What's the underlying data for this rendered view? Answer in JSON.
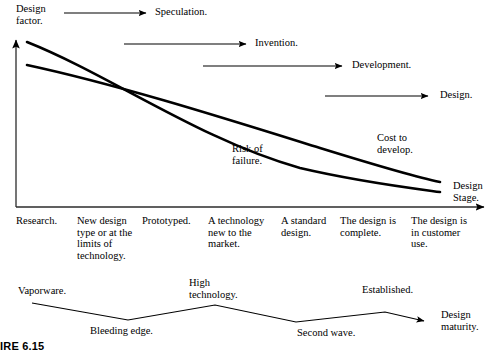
{
  "figure": {
    "caption": "IRE 6.15",
    "axes": {
      "y_title": "Design\nfactor.",
      "x_title": "Design\nStage."
    },
    "phase_arrows": [
      {
        "label": "Speculation.",
        "x1": 64,
        "x2": 148,
        "y": 13,
        "label_x": 155,
        "label_y": 8
      },
      {
        "label": "Invention.",
        "x1": 124,
        "x2": 248,
        "y": 44,
        "label_x": 255,
        "label_y": 38
      },
      {
        "label": "Development.",
        "x1": 203,
        "x2": 344,
        "y": 66,
        "label_x": 352,
        "label_y": 60
      },
      {
        "label": "Design.",
        "x1": 325,
        "x2": 430,
        "y": 96,
        "label_x": 440,
        "label_y": 90
      }
    ],
    "curves": [
      {
        "name": "risk-of-failure-curve",
        "label": "Risk of\nfailure.",
        "label_x": 232,
        "label_y": 144,
        "path": "M 27 42 C 110 75, 200 140, 300 168 C 360 182, 410 188, 440 192"
      },
      {
        "name": "cost-to-develop-curve",
        "label": "Cost to\ndevelop.",
        "label_x": 378,
        "label_y": 133,
        "path": "M 27 65 C 120 85, 230 120, 320 148 C 375 165, 415 177, 440 182"
      }
    ],
    "stages": [
      {
        "label": "Research.",
        "x": 16,
        "y": 221
      },
      {
        "label": "New design\ntype or at the\nlimits of\ntechnology.",
        "x": 77,
        "y": 221
      },
      {
        "label": "Prototyped.",
        "x": 142,
        "y": 221
      },
      {
        "label": "A technology\nnew to the\nmarket.",
        "x": 208,
        "y": 221
      },
      {
        "label": "A standard\ndesign.",
        "x": 281,
        "y": 221
      },
      {
        "label": "The design is\ncomplete.",
        "x": 340,
        "y": 221
      },
      {
        "label": "The design is\nin customer\nuse.",
        "x": 411,
        "y": 221
      }
    ],
    "maturity": {
      "zigzag_path": "M 32 303 L 128 320 L 215 305 L 296 322 L 385 312 L 428 322",
      "arrow_tip_x": 432,
      "arrow_tip_y": 322,
      "labels": [
        {
          "name": "vaporware-label",
          "text": "Vaporware.",
          "x": 18,
          "y": 286
        },
        {
          "name": "bleeding-edge-label",
          "text": "Bleeding edge.",
          "x": 90,
          "y": 326
        },
        {
          "name": "high-technology-label",
          "text": "High\ntechnology.",
          "x": 189,
          "y": 278
        },
        {
          "name": "second-wave-label",
          "text": "Second wave.",
          "x": 298,
          "y": 328
        },
        {
          "name": "established-label",
          "text": "Established.",
          "x": 362,
          "y": 285
        },
        {
          "name": "design-maturity-label",
          "text": "Design\nmaturity.",
          "x": 441,
          "y": 310
        }
      ]
    },
    "colors": {
      "ink": "#000000",
      "axis": "#2b2b2b",
      "background": "#ffffff"
    }
  }
}
